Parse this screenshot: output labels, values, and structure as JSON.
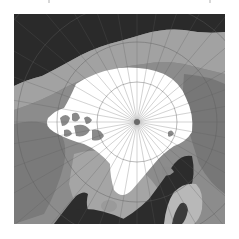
{
  "map": {
    "type": "polar-stereographic",
    "region": "Arctic",
    "colors": {
      "ocean": "#2e2e2e",
      "land_light": "#a9a9a9",
      "land_mid": "#8c8c8c",
      "land_dark": "#6f6f6f",
      "sea_ice": "#ffffff",
      "graticule": "#5c5c5c",
      "pole_marker": "#6a6a6a",
      "background": "#ffffff"
    },
    "pole": {
      "x": 123,
      "y": 108
    },
    "graticule": {
      "meridian_count": 36,
      "parallel_radii": [
        40,
        80,
        120,
        160,
        200,
        240
      ]
    },
    "layers": [
      "ocean",
      "land",
      "sea-ice",
      "graticule",
      "pole-marker"
    ]
  }
}
